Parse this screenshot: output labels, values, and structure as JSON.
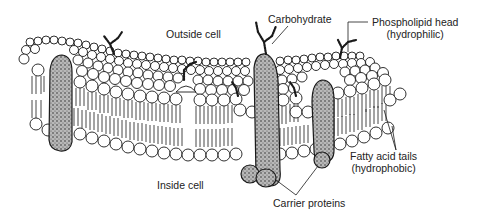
{
  "diagram": {
    "labels": {
      "outside_cell": "Outside cell",
      "inside_cell": "Inside cell",
      "carbohydrate": "Carbohydrate",
      "phospholipid_head": "Phospholipid head",
      "phospholipid_head_note": "(hydrophilic)",
      "fatty_acid_tails": "Fatty acid tails",
      "fatty_acid_tails_note": "(hydrophobic)",
      "carrier_proteins": "Carrier proteins"
    },
    "colors": {
      "ink": "#1a1a1a",
      "protein_fill": "#8a8a8a",
      "head_fill": "#ffffff",
      "background": "#ffffff"
    }
  }
}
